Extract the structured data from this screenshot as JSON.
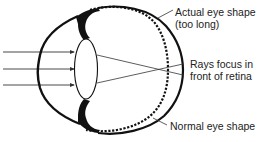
{
  "diagram": {
    "labels": {
      "actual_shape": {
        "line1": "Actual eye shape",
        "line2": "(too long)"
      },
      "rays_focus": {
        "line1": "Rays focus in",
        "line2": "front of retina"
      },
      "normal_shape": {
        "line1": "Normal eye shape"
      }
    },
    "elements": [
      {
        "id": "incoming-rays",
        "type": "arrows",
        "count": 3,
        "direction": "right"
      },
      {
        "id": "cornea",
        "type": "curve"
      },
      {
        "id": "lens",
        "type": "ellipse"
      },
      {
        "id": "iris-ciliary",
        "type": "filled-shape"
      },
      {
        "id": "actual-eye-outline",
        "type": "solid-curve"
      },
      {
        "id": "normal-eye-outline",
        "type": "dashed-curve"
      },
      {
        "id": "refracted-rays",
        "type": "lines",
        "focus_point": "in front of retina"
      }
    ],
    "colors": {
      "stroke": "#111111",
      "thin_stroke": "#333333",
      "text": "#222222",
      "background": "#ffffff"
    }
  }
}
